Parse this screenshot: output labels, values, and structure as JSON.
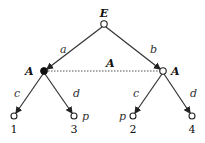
{
  "tree": {
    "root": {
      "label": "E",
      "x": 104,
      "y": 24
    },
    "info_set_label": "A",
    "nodes": [
      {
        "id": "left",
        "player": "A",
        "x": 44,
        "y": 71,
        "filled": true,
        "edge_label": "a"
      },
      {
        "id": "right",
        "player": "A",
        "x": 163,
        "y": 71,
        "filled": false,
        "edge_label": "b"
      }
    ],
    "leaves": [
      {
        "parent": "left",
        "x": 14,
        "y": 116,
        "edge_label": "c",
        "payoff": "1",
        "mark": ""
      },
      {
        "parent": "left",
        "x": 74,
        "y": 116,
        "edge_label": "d",
        "payoff": "3",
        "mark": "p"
      },
      {
        "parent": "right",
        "x": 133,
        "y": 116,
        "edge_label": "c",
        "payoff": "2",
        "mark": "p"
      },
      {
        "parent": "right",
        "x": 192,
        "y": 116,
        "edge_label": "d",
        "payoff": "4",
        "mark": ""
      }
    ]
  }
}
